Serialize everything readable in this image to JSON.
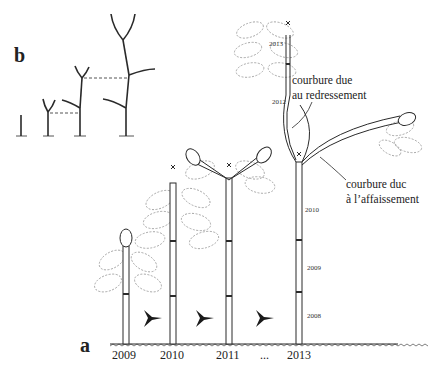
{
  "panels": {
    "a": {
      "label": "a"
    },
    "b": {
      "label": "b"
    }
  },
  "years_axis": [
    "2009",
    "2010",
    "2011",
    "...",
    "2013"
  ],
  "segment_labels": {
    "s2008": "2008",
    "s2009": "2009",
    "s2010": "2010",
    "s2012": "2012",
    "s2013": "2013"
  },
  "annotations": {
    "redressement": {
      "line1": "courbure due",
      "line2": "au redressement"
    },
    "affaissement": {
      "line1": "courbure duc",
      "line2": "à l’affaissement"
    }
  },
  "colors": {
    "stroke": "#2a2a2a",
    "leaf": "#9a9a9a",
    "fill": "#ffffff"
  }
}
